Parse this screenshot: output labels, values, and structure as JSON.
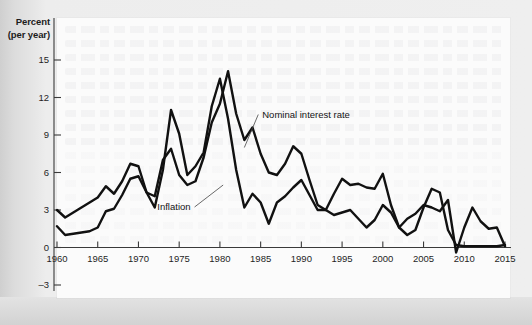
{
  "figure": {
    "y_axis_title_line1": "Percent",
    "y_axis_title_line2": "(per year)"
  },
  "chart_data": {
    "type": "line",
    "title": "",
    "xlabel": "",
    "ylabel": "Percent (per year)",
    "xlim": [
      1960,
      2015
    ],
    "ylim": [
      -3,
      15
    ],
    "yticks": [
      15,
      12,
      9,
      6,
      3,
      0,
      -3
    ],
    "ytick_labels": [
      "15",
      "12",
      "9",
      "6",
      "3",
      "0",
      "–3"
    ],
    "xticks": [
      1960,
      1965,
      1970,
      1975,
      1980,
      1985,
      1990,
      1995,
      2000,
      2005,
      2010,
      2015
    ],
    "xtick_labels": [
      "1960",
      "1965",
      "1970",
      "1975",
      "1980",
      "1985",
      "1990",
      "1995",
      "2000",
      "2005",
      "2010",
      "2015"
    ],
    "grid": false,
    "legend_position": "inline-annotations",
    "annotations": [
      {
        "text": "Nominal interest rate",
        "x": 1985.2,
        "y": 10.4,
        "anchor_x": 1983.0,
        "anchor_y": 8.0
      },
      {
        "text": "Inflation",
        "x": 1976.4,
        "y": 3.0,
        "anchor_x": 1980.4,
        "anchor_y": 5.0
      }
    ],
    "x": [
      1960,
      1961,
      1962,
      1963,
      1964,
      1965,
      1966,
      1967,
      1968,
      1969,
      1970,
      1971,
      1972,
      1973,
      1974,
      1975,
      1976,
      1977,
      1978,
      1979,
      1980,
      1981,
      1982,
      1983,
      1984,
      1985,
      1986,
      1987,
      1988,
      1989,
      1990,
      1991,
      1992,
      1993,
      1994,
      1995,
      1996,
      1997,
      1998,
      1999,
      2000,
      2001,
      2002,
      2003,
      2004,
      2005,
      2006,
      2007,
      2008,
      2009,
      2010,
      2011,
      2012,
      2013,
      2014,
      2015
    ],
    "series": [
      {
        "name": "Nominal interest rate",
        "values": [
          3.0,
          2.4,
          2.8,
          3.2,
          3.6,
          4.0,
          4.9,
          4.3,
          5.3,
          6.7,
          6.5,
          4.4,
          4.1,
          7.0,
          7.9,
          5.8,
          5.0,
          5.3,
          7.2,
          10.0,
          11.5,
          14.1,
          10.7,
          8.6,
          9.6,
          7.5,
          6.0,
          5.8,
          6.7,
          8.1,
          7.5,
          5.4,
          3.4,
          3.0,
          4.3,
          5.5,
          5.0,
          5.1,
          4.8,
          4.7,
          5.9,
          3.4,
          1.6,
          1.0,
          1.4,
          3.2,
          4.7,
          4.4,
          1.4,
          0.2,
          0.1,
          0.1,
          0.1,
          0.1,
          0.1,
          0.2
        ],
        "color": "#111111"
      },
      {
        "name": "Inflation",
        "values": [
          1.7,
          1.0,
          1.1,
          1.2,
          1.3,
          1.6,
          2.9,
          3.1,
          4.2,
          5.5,
          5.7,
          4.4,
          3.2,
          6.2,
          11.0,
          9.1,
          5.8,
          6.5,
          7.6,
          11.3,
          13.5,
          10.3,
          6.2,
          3.2,
          4.3,
          3.6,
          1.9,
          3.6,
          4.1,
          4.8,
          5.4,
          4.2,
          3.0,
          3.0,
          2.6,
          2.8,
          3.0,
          2.3,
          1.6,
          2.2,
          3.4,
          2.8,
          1.6,
          2.3,
          2.7,
          3.4,
          3.2,
          2.9,
          3.8,
          -0.4,
          1.6,
          3.2,
          2.1,
          1.5,
          1.6,
          0.1
        ],
        "color": "#111111"
      }
    ]
  }
}
